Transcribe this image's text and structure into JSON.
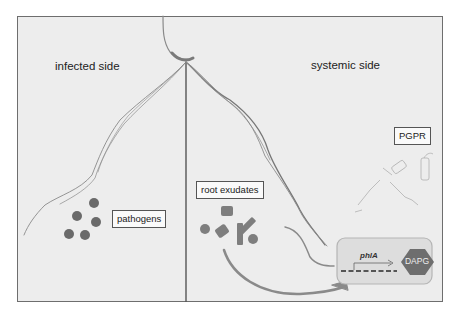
{
  "labels": {
    "infected_side": "infected side",
    "systemic_side": "systemic side",
    "pathogens": "pathogens",
    "root_exudates": "root exudates",
    "pgpr": "PGPR",
    "gene": "phlA",
    "compound": "DAPG"
  },
  "colors": {
    "frame_bg": "#ededed",
    "frame_border": "#6e6e6e",
    "divider": "#555555",
    "pathogen": "#6a6a6a",
    "exudate": "#7a7a7a",
    "gene_box_bg": "#dddddd",
    "gene_box_border": "#b5b5b5",
    "hexagon": "#6e6e6e",
    "root": "#8a8a8a"
  }
}
